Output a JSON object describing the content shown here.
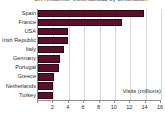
{
  "chart_data": {
    "type": "bar",
    "orientation": "horizontal",
    "title": "UK residents' visits abroad by destination",
    "title_visible_partial": true,
    "categories": [
      "Spain",
      "France",
      "USA",
      "Irish Republic",
      "Italy",
      "Germany",
      "Portugal",
      "Greece",
      "Netherlands",
      "Turkey"
    ],
    "values": [
      13.8,
      10.9,
      3.9,
      3.9,
      3.4,
      2.9,
      2.7,
      2.1,
      2.0,
      1.9
    ],
    "series": [
      {
        "name": "Visits (millions)",
        "values": [
          13.8,
          10.9,
          3.9,
          3.9,
          3.4,
          2.9,
          2.7,
          2.1,
          2.0,
          1.9
        ]
      }
    ],
    "xlabel": "Visits (millions)",
    "ylabel": "",
    "xlim": [
      0,
      16
    ],
    "ylim": null,
    "xticks": [
      0,
      2,
      4,
      6,
      8,
      10,
      12,
      14,
      16
    ],
    "xtick_labels": [
      "",
      "2",
      "4",
      "6",
      "8",
      "10",
      "12",
      "14",
      "16"
    ],
    "grid": true,
    "grid_axis": "x",
    "legend": false,
    "legend_position": "none",
    "bar_color": "#5c1028",
    "bar_edge_color": "#2e0714",
    "grid_color": "#d8d8d8",
    "axis_color": "#8a8a8a",
    "text_color": "#2b2b2b",
    "background": "#ffffff",
    "annotations": [
      {
        "text": "Visits (millions)",
        "position": "inside-bottom-right"
      }
    ]
  }
}
